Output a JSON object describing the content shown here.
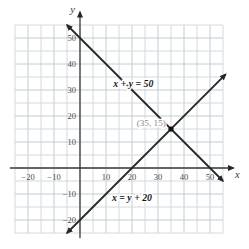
{
  "figure": {
    "kind": "linear-system-graph"
  },
  "chart_data": {
    "type": "line",
    "title": "",
    "xlabel": "x",
    "ylabel": "y",
    "xlim": [
      -27,
      60
    ],
    "ylim": [
      -28,
      61
    ],
    "grid": {
      "on": true,
      "step": 5,
      "x_range": [
        -25,
        55
      ],
      "y_range": [
        -25,
        55
      ]
    },
    "x_ticks": [
      {
        "value": -20,
        "label": "−20"
      },
      {
        "value": -10,
        "label": "−10"
      },
      {
        "value": 10,
        "label": "10"
      },
      {
        "value": 20,
        "label": "20"
      },
      {
        "value": 30,
        "label": "30"
      },
      {
        "value": 40,
        "label": "40"
      },
      {
        "value": 50,
        "label": "50"
      }
    ],
    "y_ticks": [
      {
        "value": 50,
        "label": "50"
      },
      {
        "value": 40,
        "label": "40"
      },
      {
        "value": 30,
        "label": "30"
      },
      {
        "value": 20,
        "label": "20"
      },
      {
        "value": 10,
        "label": "10"
      },
      {
        "value": -10,
        "label": "−10"
      },
      {
        "value": -20,
        "label": "−20"
      }
    ],
    "series": [
      {
        "name": "x + y = 50",
        "equation_label": "x + y = 50",
        "points": [
          [
            -5,
            55
          ],
          [
            55,
            -5
          ]
        ],
        "label_pos": [
          20.5,
          31
        ]
      },
      {
        "name": "x = y + 20",
        "equation_label": "x = y + 20",
        "points": [
          [
            -5,
            -25
          ],
          [
            56,
            36
          ]
        ],
        "label_pos": [
          20,
          -12.5
        ]
      }
    ],
    "intersection_point": {
      "x": 35,
      "y": 15,
      "label": "(35, 15)",
      "label_anchor": [
        33,
        16
      ]
    },
    "legend": null
  },
  "colors": {
    "background": "#ffffff",
    "grid_minor": "#d3dade",
    "grid_major": "#c2ccd2",
    "axis": "#3a3a3a",
    "line": "#262626",
    "tick_text": "#4c4c4c",
    "equation_text": "#141414",
    "point": "#111111",
    "point_label_text": "#8d8d8d"
  }
}
